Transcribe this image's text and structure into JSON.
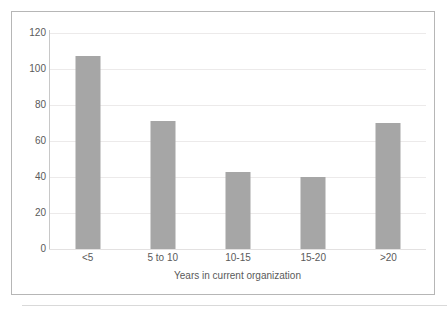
{
  "chart_data": {
    "type": "bar",
    "title": "",
    "xlabel": "Years in current organization",
    "ylabel": "",
    "categories": [
      "<5",
      "5 to 10",
      "10-15",
      "15-20",
      ">20"
    ],
    "values": [
      107,
      71,
      43,
      40,
      70
    ],
    "series": [
      {
        "name": "Count",
        "values": [
          107,
          71,
          43,
          40,
          70
        ]
      }
    ],
    "ylim": [
      0,
      120
    ],
    "y_ticks": [
      0,
      20,
      40,
      60,
      80,
      100,
      120
    ],
    "y_tick_labels": [
      "0",
      "20",
      "40",
      "60",
      "80",
      "100",
      "120"
    ],
    "grid": true,
    "grid_axis": "y",
    "legend": false,
    "legend_position": "none",
    "bar_color": "#a6a6a6",
    "gridline_color": "#eceaea",
    "axis_color": "#c8c8c8",
    "text_color": "#5a5a5a",
    "border_color": "#b6b6b6",
    "background_color": "#ffffff"
  }
}
